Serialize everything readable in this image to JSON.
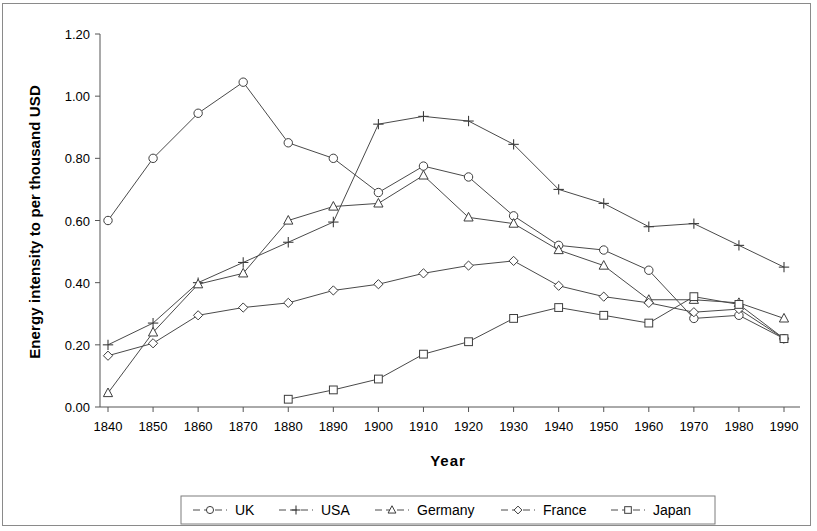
{
  "chart_data": {
    "type": "line",
    "title": "",
    "xlabel": "Year",
    "ylabel": "Energy intensity to per thousand USD",
    "x": [
      1840,
      1850,
      1860,
      1870,
      1880,
      1890,
      1900,
      1910,
      1920,
      1930,
      1940,
      1950,
      1960,
      1970,
      1980,
      1990
    ],
    "xtick_labels": [
      "1840",
      "1850",
      "1860",
      "1870",
      "1880",
      "1890",
      "1900",
      "1910",
      "1920",
      "1930",
      "1940",
      "1950",
      "1960",
      "1970",
      "1980",
      "1990"
    ],
    "ytick_labels": [
      "0.00",
      "0.20",
      "0.40",
      "0.60",
      "0.80",
      "1.00",
      "1.20"
    ],
    "ytick_values": [
      0.0,
      0.2,
      0.4,
      0.6,
      0.8,
      1.0,
      1.2
    ],
    "ylim": [
      0.0,
      1.2
    ],
    "xlim": [
      1840,
      1990
    ],
    "grid": false,
    "legend_position": "bottom",
    "series": [
      {
        "name": "UK",
        "marker": "circle",
        "values": [
          0.6,
          0.8,
          0.945,
          1.045,
          0.85,
          0.8,
          0.69,
          0.775,
          0.74,
          0.615,
          0.52,
          0.505,
          0.44,
          0.285,
          0.295,
          0.22
        ]
      },
      {
        "name": "USA",
        "marker": "plus",
        "values": [
          0.2,
          0.27,
          0.4,
          0.465,
          0.53,
          0.595,
          0.91,
          0.935,
          0.92,
          0.845,
          0.7,
          0.655,
          0.58,
          0.59,
          0.52,
          0.45
        ]
      },
      {
        "name": "Germany",
        "marker": "triangle",
        "values": [
          0.045,
          0.24,
          0.395,
          0.43,
          0.6,
          0.645,
          0.655,
          0.745,
          0.61,
          0.59,
          0.505,
          0.455,
          0.345,
          0.345,
          0.335,
          0.285
        ]
      },
      {
        "name": "France",
        "marker": "diamond",
        "values": [
          0.165,
          0.205,
          0.295,
          0.32,
          0.335,
          0.375,
          0.395,
          0.43,
          0.455,
          0.47,
          0.39,
          0.355,
          0.335,
          0.305,
          0.315,
          0.22
        ]
      },
      {
        "name": "Japan",
        "marker": "square",
        "values": [
          null,
          null,
          null,
          null,
          0.025,
          0.055,
          0.09,
          0.17,
          0.21,
          0.285,
          0.32,
          0.295,
          0.27,
          0.355,
          0.33,
          0.22
        ]
      }
    ]
  },
  "legend": {
    "items": [
      {
        "label": "UK",
        "marker": "circle"
      },
      {
        "label": "USA",
        "marker": "plus"
      },
      {
        "label": "Germany",
        "marker": "triangle"
      },
      {
        "label": "France",
        "marker": "diamond"
      },
      {
        "label": "Japan",
        "marker": "square"
      }
    ]
  }
}
